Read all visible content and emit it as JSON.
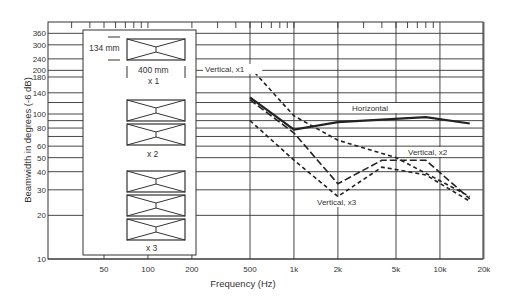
{
  "chart_data": {
    "type": "line",
    "title": "",
    "xlabel": "Frequency (Hz)",
    "ylabel": "Beamwidth in degrees (-6 dB)",
    "xscale": "log",
    "yscale": "log",
    "xlim": [
      20,
      20000
    ],
    "ylim": [
      10,
      400
    ],
    "x_ticks": [
      {
        "v": 50,
        "label": "50"
      },
      {
        "v": 100,
        "label": "100"
      },
      {
        "v": 200,
        "label": "200"
      },
      {
        "v": 500,
        "label": "500"
      },
      {
        "v": 1000,
        "label": "1k"
      },
      {
        "v": 2000,
        "label": "2k"
      },
      {
        "v": 5000,
        "label": "5k"
      },
      {
        "v": 10000,
        "label": "10k"
      },
      {
        "v": 20000,
        "label": "20k"
      }
    ],
    "y_ticks": [
      {
        "v": 10,
        "label": "10"
      },
      {
        "v": 20,
        "label": "20"
      },
      {
        "v": 30,
        "label": "30"
      },
      {
        "v": 40,
        "label": "40"
      },
      {
        "v": 50,
        "label": "50"
      },
      {
        "v": 60,
        "label": "60"
      },
      {
        "v": 80,
        "label": "80"
      },
      {
        "v": 100,
        "label": "100"
      },
      {
        "v": 140,
        "label": "140"
      },
      {
        "v": 180,
        "label": "180"
      },
      {
        "v": 200,
        "label": "200"
      },
      {
        "v": 240,
        "label": "240"
      },
      {
        "v": 300,
        "label": "300"
      },
      {
        "v": 360,
        "label": "360"
      }
    ],
    "y_minor_gridlines": [
      70,
      90,
      120
    ],
    "grid": true,
    "series": [
      {
        "name": "Horizontal",
        "style": "solid",
        "width": 2.2,
        "x": [
          500,
          1000,
          2000,
          8000,
          16000
        ],
        "y": [
          130,
          78,
          88,
          95,
          86
        ]
      },
      {
        "name": "Vertical, x1",
        "style": "dash-short",
        "width": 1.6,
        "x": [
          500,
          1000,
          2000,
          5000,
          16000
        ],
        "y": [
          210,
          97,
          66,
          50,
          27
        ]
      },
      {
        "name": "Vertical, x2",
        "style": "dash-long",
        "width": 1.6,
        "x": [
          500,
          1000,
          2000,
          4000,
          8000,
          16000
        ],
        "y": [
          125,
          74,
          33,
          48,
          48,
          26
        ]
      },
      {
        "name": "Vertical, x3",
        "style": "dash-short",
        "width": 1.6,
        "x": [
          500,
          1000,
          2000,
          4000,
          8000,
          16000
        ],
        "y": [
          90,
          48,
          27,
          43,
          38,
          25
        ]
      }
    ],
    "annotations": [
      {
        "text": "Vertical, x1",
        "x": 205,
        "y": 72
      },
      {
        "text": "Horizontal",
        "x": 352,
        "y": 111
      },
      {
        "text": "Vertical, x2",
        "x": 408,
        "y": 155
      },
      {
        "text": "Vertical, x3",
        "x": 317,
        "y": 205
      }
    ],
    "inset": {
      "dimension_height": "134 mm",
      "dimension_width": "400 mm",
      "labels": [
        "x 1",
        "x 2",
        "x 3"
      ]
    }
  }
}
